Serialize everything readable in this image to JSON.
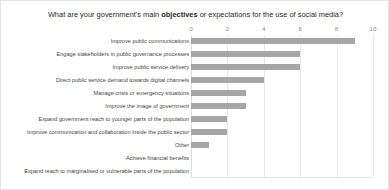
{
  "chart_data": {
    "type": "bar",
    "orientation": "horizontal",
    "title_prefix": "What are your government's main ",
    "title_bold": "objectives",
    "title_suffix": " or expectations for the use of social media?",
    "title": "What are your government's main objectives or expectations for the use of social media?",
    "xlabel": "",
    "ylabel": "",
    "xlim": [
      0,
      10
    ],
    "grid": true,
    "legend": "none",
    "axis_position": "top",
    "bar_color": "#a6a6a6",
    "gridline_color": "#e8e8e8",
    "tick_label_color": "#8c8c8c",
    "category_label_color": "#3f3f3f",
    "xticks": [
      0,
      2,
      4,
      6,
      8,
      10
    ],
    "xtick_labels": [
      "0",
      "2",
      "4",
      "6",
      "8",
      "10"
    ],
    "categories": [
      "Improve public communications",
      "Engage stakeholders in public governance processes",
      "Improve public service delivery",
      "Direct public service demand towards digital channels",
      "Manage crisis or emergency situations",
      "Improve the image of government",
      "Expand government reach to younger parts of the population",
      "Improve communication and collaboration inside the public sector",
      "Other",
      "Achieve financial benefits",
      "Expand reach to marginalised or vulnerable parts of the population"
    ],
    "values": [
      9,
      6,
      6,
      4,
      3,
      3,
      2,
      2,
      1,
      0,
      0
    ]
  }
}
